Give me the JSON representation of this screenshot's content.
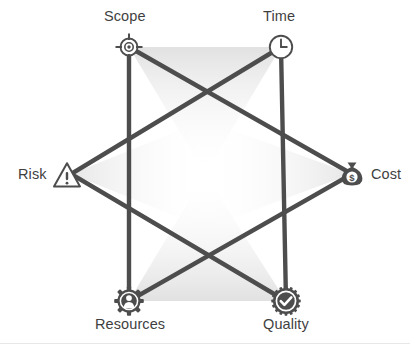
{
  "diagram": {
    "type": "hexagram-star",
    "line_color": "#4d4d4d",
    "label_color": "#3f3f3f",
    "background_color": "#ffffff",
    "rule_color": "#e8e8ea",
    "nodes": [
      {
        "id": "scope",
        "label": "Scope",
        "icon": "crosshair-target-icon",
        "x": 129,
        "y": 47,
        "label_x": 104,
        "label_y": 8
      },
      {
        "id": "time",
        "label": "Time",
        "icon": "clock-icon",
        "x": 281,
        "y": 47,
        "label_x": 263,
        "label_y": 8
      },
      {
        "id": "cost",
        "label": "Cost",
        "icon": "money-bag-icon",
        "x": 352,
        "y": 174,
        "label_x": 371,
        "label_y": 166
      },
      {
        "id": "quality",
        "label": "Quality",
        "icon": "quality-check-badge-icon",
        "x": 286,
        "y": 301,
        "label_x": 263,
        "label_y": 316
      },
      {
        "id": "resources",
        "label": "Resources",
        "icon": "gear-person-icon",
        "x": 129,
        "y": 301,
        "label_x": 95,
        "label_y": 316
      },
      {
        "id": "risk",
        "label": "Risk",
        "icon": "warning-triangle-icon",
        "x": 71,
        "y": 174,
        "label_x": 18,
        "label_y": 166
      }
    ],
    "edges": [
      {
        "from": "scope",
        "to": "cost"
      },
      {
        "from": "cost",
        "to": "resources"
      },
      {
        "from": "resources",
        "to": "scope"
      },
      {
        "from": "time",
        "to": "quality"
      },
      {
        "from": "quality",
        "to": "risk"
      },
      {
        "from": "risk",
        "to": "time"
      }
    ]
  }
}
